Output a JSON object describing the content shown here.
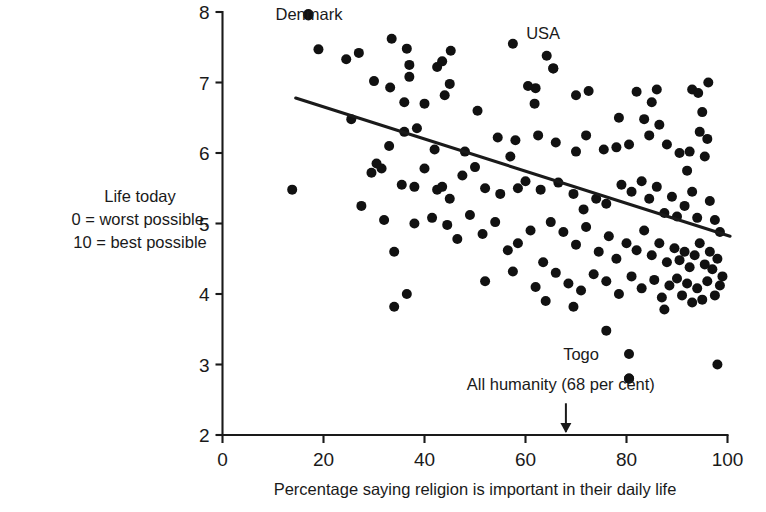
{
  "chart_data": {
    "type": "scatter",
    "title": "",
    "xlabel": "Percentage saying religion is important in their daily life",
    "ylabel": "Life today\n0 = worst possible,\n10 = best possible",
    "ylabel_lines": [
      "Life today",
      "0 = worst possible,",
      "10 = best possible"
    ],
    "xlim": [
      0,
      100
    ],
    "ylim": [
      2,
      8
    ],
    "xticks": [
      0,
      20,
      40,
      60,
      80,
      100
    ],
    "yticks": [
      2,
      3,
      4,
      5,
      6,
      7,
      8
    ],
    "xtick_labels": [
      "0",
      "20",
      "40",
      "60",
      "80",
      "100"
    ],
    "ytick_labels": [
      "2",
      "3",
      "4",
      "5",
      "6",
      "7",
      "8"
    ],
    "grid": false,
    "legend": "none",
    "marker_color": "#111111",
    "line_color": "#1a1a1a",
    "annotations": [
      {
        "label": "Denmark",
        "x": 17,
        "y": 7.95,
        "text_x": 10.5,
        "text_y": 7.88,
        "anchor": "start",
        "has_point": true
      },
      {
        "label": "USA",
        "x": 65.5,
        "y": 7.2,
        "text_x": 63.5,
        "text_y": 7.62,
        "anchor": "middle",
        "has_point": true
      },
      {
        "label": "Togo",
        "x": 80.5,
        "y": 2.8,
        "text_x": 71.0,
        "text_y": 3.07,
        "anchor": "middle",
        "has_point": true
      },
      {
        "label": "All humanity (68 per cent)",
        "x": 68,
        "y": 2.0,
        "text_x": 67.0,
        "text_y": 2.64,
        "anchor": "middle",
        "has_point": false
      }
    ],
    "arrow": {
      "x": 68,
      "y_from": 2.45,
      "y_to": 2.03,
      "label": "All humanity (68 per cent)"
    },
    "trend": {
      "x0": 14.5,
      "y0": 6.78,
      "x1": 100.5,
      "y1": 4.82,
      "slope": -0.0228,
      "intercept": 7.111
    },
    "points": [
      [
        17.0,
        7.97
      ],
      [
        19.0,
        7.47
      ],
      [
        24.5,
        7.33
      ],
      [
        27.0,
        7.42
      ],
      [
        33.5,
        7.62
      ],
      [
        36.5,
        7.48
      ],
      [
        37.0,
        7.25
      ],
      [
        37.0,
        7.08
      ],
      [
        42.5,
        7.22
      ],
      [
        43.5,
        7.3
      ],
      [
        45.2,
        7.45
      ],
      [
        57.5,
        7.55
      ],
      [
        64.2,
        7.38
      ],
      [
        65.5,
        7.2
      ],
      [
        45.0,
        6.98
      ],
      [
        44.0,
        6.82
      ],
      [
        30.0,
        7.02
      ],
      [
        33.2,
        6.93
      ],
      [
        25.5,
        6.48
      ],
      [
        36.0,
        6.72
      ],
      [
        40.0,
        6.7
      ],
      [
        50.5,
        6.6
      ],
      [
        60.5,
        6.95
      ],
      [
        62.0,
        6.92
      ],
      [
        61.8,
        6.7
      ],
      [
        70.0,
        6.82
      ],
      [
        72.5,
        6.88
      ],
      [
        78.5,
        6.5
      ],
      [
        82.0,
        6.87
      ],
      [
        86.0,
        6.9
      ],
      [
        85.0,
        6.72
      ],
      [
        83.5,
        6.48
      ],
      [
        86.5,
        6.4
      ],
      [
        84.5,
        6.25
      ],
      [
        93.0,
        6.9
      ],
      [
        94.2,
        6.85
      ],
      [
        96.2,
        7.0
      ],
      [
        95.0,
        6.58
      ],
      [
        94.5,
        6.3
      ],
      [
        96.0,
        6.2
      ],
      [
        92.5,
        6.02
      ],
      [
        95.5,
        5.95
      ],
      [
        36.0,
        6.3
      ],
      [
        38.5,
        6.35
      ],
      [
        33.0,
        6.1
      ],
      [
        13.8,
        5.48
      ],
      [
        30.5,
        5.85
      ],
      [
        31.5,
        5.78
      ],
      [
        42.0,
        6.05
      ],
      [
        48.0,
        6.02
      ],
      [
        54.5,
        6.22
      ],
      [
        57.0,
        5.95
      ],
      [
        58.0,
        6.18
      ],
      [
        62.5,
        6.25
      ],
      [
        66.0,
        6.15
      ],
      [
        70.0,
        6.02
      ],
      [
        72.0,
        6.25
      ],
      [
        75.5,
        6.05
      ],
      [
        78.0,
        6.08
      ],
      [
        80.5,
        6.12
      ],
      [
        88.0,
        6.12
      ],
      [
        90.5,
        6.0
      ],
      [
        92.0,
        5.75
      ],
      [
        27.5,
        5.25
      ],
      [
        29.5,
        5.72
      ],
      [
        35.5,
        5.55
      ],
      [
        38.0,
        5.52
      ],
      [
        40.0,
        5.78
      ],
      [
        42.5,
        5.48
      ],
      [
        43.5,
        5.52
      ],
      [
        45.0,
        5.35
      ],
      [
        47.5,
        5.68
      ],
      [
        50.0,
        5.8
      ],
      [
        52.0,
        5.5
      ],
      [
        55.0,
        5.42
      ],
      [
        58.5,
        5.5
      ],
      [
        60.0,
        5.6
      ],
      [
        63.0,
        5.48
      ],
      [
        66.5,
        5.58
      ],
      [
        69.5,
        5.42
      ],
      [
        71.5,
        5.2
      ],
      [
        74.0,
        5.35
      ],
      [
        76.0,
        5.28
      ],
      [
        79.0,
        5.55
      ],
      [
        81.0,
        5.45
      ],
      [
        83.0,
        5.6
      ],
      [
        84.5,
        5.35
      ],
      [
        86.0,
        5.52
      ],
      [
        87.5,
        5.15
      ],
      [
        89.0,
        5.38
      ],
      [
        90.0,
        5.1
      ],
      [
        91.5,
        5.25
      ],
      [
        93.0,
        5.45
      ],
      [
        94.0,
        5.08
      ],
      [
        96.5,
        5.32
      ],
      [
        97.5,
        5.05
      ],
      [
        98.5,
        4.88
      ],
      [
        32.0,
        5.05
      ],
      [
        34.0,
        4.6
      ],
      [
        38.0,
        5.0
      ],
      [
        41.5,
        5.08
      ],
      [
        44.5,
        4.98
      ],
      [
        46.5,
        4.78
      ],
      [
        49.0,
        5.12
      ],
      [
        51.5,
        4.85
      ],
      [
        54.0,
        5.02
      ],
      [
        56.5,
        4.62
      ],
      [
        58.5,
        4.72
      ],
      [
        61.0,
        4.9
      ],
      [
        63.5,
        4.45
      ],
      [
        65.0,
        5.02
      ],
      [
        67.5,
        4.88
      ],
      [
        70.0,
        4.7
      ],
      [
        72.0,
        4.95
      ],
      [
        74.5,
        4.6
      ],
      [
        76.5,
        4.82
      ],
      [
        78.0,
        4.5
      ],
      [
        80.0,
        4.72
      ],
      [
        82.0,
        4.62
      ],
      [
        83.5,
        4.9
      ],
      [
        85.0,
        4.55
      ],
      [
        86.5,
        4.72
      ],
      [
        88.0,
        4.45
      ],
      [
        89.5,
        4.65
      ],
      [
        90.5,
        4.48
      ],
      [
        91.5,
        4.6
      ],
      [
        92.5,
        4.38
      ],
      [
        93.5,
        4.55
      ],
      [
        94.5,
        4.72
      ],
      [
        95.5,
        4.42
      ],
      [
        96.5,
        4.6
      ],
      [
        97.0,
        4.35
      ],
      [
        98.0,
        4.5
      ],
      [
        99.0,
        4.25
      ],
      [
        34.0,
        3.82
      ],
      [
        36.5,
        4.0
      ],
      [
        52.0,
        4.18
      ],
      [
        57.5,
        4.32
      ],
      [
        62.0,
        4.1
      ],
      [
        66.0,
        4.3
      ],
      [
        68.5,
        4.15
      ],
      [
        71.0,
        4.05
      ],
      [
        73.5,
        4.28
      ],
      [
        76.0,
        4.18
      ],
      [
        78.5,
        4.0
      ],
      [
        81.0,
        4.25
      ],
      [
        83.0,
        4.08
      ],
      [
        85.5,
        4.2
      ],
      [
        87.0,
        3.95
      ],
      [
        88.5,
        4.12
      ],
      [
        90.0,
        4.22
      ],
      [
        91.0,
        3.98
      ],
      [
        92.0,
        4.15
      ],
      [
        93.0,
        3.88
      ],
      [
        94.0,
        4.08
      ],
      [
        95.0,
        3.92
      ],
      [
        96.0,
        4.18
      ],
      [
        97.5,
        3.98
      ],
      [
        98.5,
        4.12
      ],
      [
        80.5,
        3.15
      ],
      [
        80.5,
        2.8
      ],
      [
        87.5,
        3.78
      ],
      [
        98.0,
        3.0
      ],
      [
        76.0,
        3.48
      ],
      [
        69.5,
        3.82
      ],
      [
        64.0,
        3.9
      ]
    ]
  }
}
